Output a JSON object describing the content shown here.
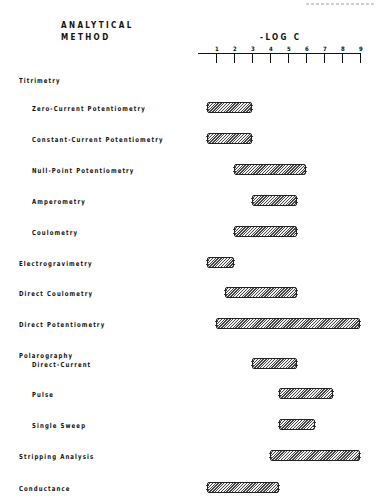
{
  "header": {
    "method_label_line1": "ANALYTICAL",
    "method_label_line2": "METHOD",
    "axis_title": "-LOG C"
  },
  "axis": {
    "ticks": [
      "1",
      "2",
      "3",
      "4",
      "5",
      "6",
      "7",
      "8",
      "9"
    ]
  },
  "rows": [
    {
      "label": "Titrimetry",
      "indent": 0,
      "y": 76,
      "bar": null
    },
    {
      "label": "Zero-Current Potentiometry",
      "indent": 1,
      "y": 104,
      "bar": [
        0.5,
        3
      ]
    },
    {
      "label": "Constant-Current Potentiometry",
      "indent": 1,
      "y": 135,
      "bar": [
        0.5,
        3
      ]
    },
    {
      "label": "Null-Point Potentiometry",
      "indent": 1,
      "y": 166,
      "bar": [
        2,
        6
      ]
    },
    {
      "label": "Amperometry",
      "indent": 1,
      "y": 197,
      "bar": [
        3,
        5.5
      ]
    },
    {
      "label": "Coulometry",
      "indent": 1,
      "y": 228,
      "bar": [
        2,
        5.5
      ]
    },
    {
      "label": "Electrogravimetry",
      "indent": 0,
      "y": 259,
      "bar": [
        0.5,
        2
      ]
    },
    {
      "label": "Direct Coulometry",
      "indent": 0,
      "y": 289,
      "bar": [
        1.5,
        5.5
      ]
    },
    {
      "label": "Direct Potentiometry",
      "indent": 0,
      "y": 320,
      "bar": [
        1,
        9
      ]
    },
    {
      "label": "Polarography",
      "indent": 0,
      "y": 351,
      "bar": null
    },
    {
      "label": "Direct-Current",
      "indent": 1,
      "y": 360,
      "bar": [
        3,
        5.5
      ]
    },
    {
      "label": "Pulse",
      "indent": 1,
      "y": 390,
      "bar": [
        4.5,
        7.5
      ]
    },
    {
      "label": "Single Sweep",
      "indent": 1,
      "y": 421,
      "bar": [
        4.5,
        6.5
      ]
    },
    {
      "label": "Stripping Analysis",
      "indent": 0,
      "y": 452,
      "bar": [
        4,
        9
      ]
    },
    {
      "label": "Conductance",
      "indent": 0,
      "y": 484,
      "bar": [
        0.5,
        4.5
      ]
    }
  ],
  "chart_data": {
    "type": "bar",
    "orientation": "horizontal-range",
    "title": "",
    "xlabel": "-LOG C",
    "ylabel": "ANALYTICAL METHOD",
    "xlim": [
      1,
      9
    ],
    "x_ticks": [
      1,
      2,
      3,
      4,
      5,
      6,
      7,
      8,
      9
    ],
    "grid": false,
    "legend": null,
    "groups": [
      {
        "name": "Titrimetry",
        "members": [
          "Zero-Current Potentiometry",
          "Constant-Current Potentiometry",
          "Null-Point Potentiometry",
          "Amperometry",
          "Coulometry"
        ]
      },
      {
        "name": "Polarography",
        "members": [
          "Direct-Current",
          "Pulse",
          "Single Sweep"
        ]
      }
    ],
    "categories": [
      "Zero-Current Potentiometry",
      "Constant-Current Potentiometry",
      "Null-Point Potentiometry",
      "Amperometry",
      "Coulometry",
      "Electrogravimetry",
      "Direct Coulometry",
      "Direct Potentiometry",
      "Polarography Direct-Current",
      "Polarography Pulse",
      "Polarography Single Sweep",
      "Stripping Analysis",
      "Conductance"
    ],
    "ranges": [
      [
        0.5,
        3
      ],
      [
        0.5,
        3
      ],
      [
        2,
        6
      ],
      [
        3,
        5.5
      ],
      [
        2,
        5.5
      ],
      [
        0.5,
        2
      ],
      [
        1.5,
        5.5
      ],
      [
        1,
        9
      ],
      [
        3,
        5.5
      ],
      [
        4.5,
        7.5
      ],
      [
        4.5,
        6.5
      ],
      [
        4,
        9
      ],
      [
        0.5,
        4.5
      ]
    ]
  }
}
